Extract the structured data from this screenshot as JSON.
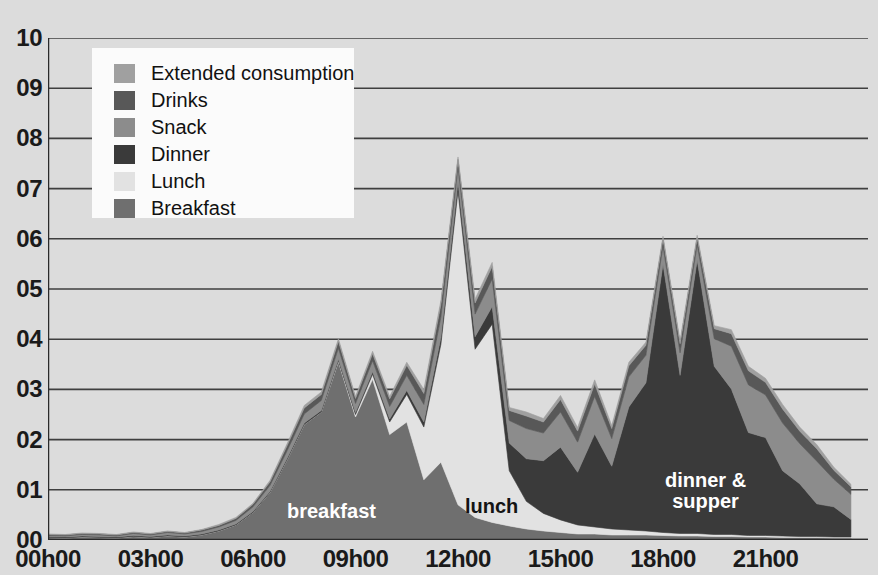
{
  "chart_data": {
    "type": "area",
    "stacked": true,
    "title": "",
    "xlabel": "",
    "ylabel": "",
    "ylim": [
      0,
      10
    ],
    "xlim": [
      0,
      24
    ],
    "grid": true,
    "legend_position": "top-left",
    "y_ticks": [
      "00",
      "01",
      "02",
      "03",
      "04",
      "05",
      "06",
      "07",
      "08",
      "09",
      "10"
    ],
    "x_ticks": [
      "00h00",
      "03h00",
      "06h00",
      "09h00",
      "12h00",
      "15h00",
      "18h00",
      "21h00"
    ],
    "x_tick_hours": [
      0,
      3,
      6,
      9,
      12,
      15,
      18,
      21
    ],
    "x": [
      0,
      0.5,
      1,
      1.5,
      2,
      2.5,
      3,
      3.5,
      4,
      4.5,
      5,
      5.5,
      6,
      6.5,
      7,
      7.5,
      8,
      8.5,
      9,
      9.5,
      10,
      10.5,
      11,
      11.5,
      12,
      12.5,
      13,
      13.5,
      14,
      14.5,
      15,
      15.5,
      16,
      16.5,
      17,
      17.5,
      18,
      18.5,
      19,
      19.5,
      20,
      20.5,
      21,
      21.5,
      22,
      22.5,
      23,
      23.5
    ],
    "series": [
      {
        "name": "Breakfast",
        "color": "#6f6f6f",
        "values": [
          0.05,
          0.04,
          0.06,
          0.05,
          0.04,
          0.07,
          0.05,
          0.08,
          0.06,
          0.1,
          0.18,
          0.3,
          0.55,
          0.95,
          1.6,
          2.3,
          2.55,
          3.55,
          2.45,
          3.2,
          2.1,
          2.35,
          1.2,
          1.55,
          0.7,
          0.45,
          0.35,
          0.28,
          0.22,
          0.18,
          0.15,
          0.12,
          0.12,
          0.1,
          0.1,
          0.1,
          0.09,
          0.08,
          0.08,
          0.07,
          0.07,
          0.06,
          0.06,
          0.05,
          0.05,
          0.05,
          0.04,
          0.04
        ]
      },
      {
        "name": "Lunch",
        "color": "#e2e2e2",
        "values": [
          0,
          0,
          0,
          0,
          0,
          0,
          0,
          0,
          0,
          0,
          0,
          0,
          0,
          0,
          0,
          0,
          0,
          0.02,
          0.05,
          0.1,
          0.25,
          0.55,
          1.05,
          2.35,
          6.25,
          3.35,
          3.95,
          1.1,
          0.55,
          0.35,
          0.25,
          0.18,
          0.14,
          0.12,
          0.1,
          0.08,
          0.06,
          0.05,
          0.05,
          0.04,
          0.04,
          0.03,
          0.03,
          0.03,
          0.02,
          0.02,
          0.02,
          0.02
        ]
      },
      {
        "name": "Dinner",
        "color": "#3a3a3a",
        "values": [
          0.02,
          0.02,
          0.02,
          0.02,
          0.02,
          0.02,
          0.02,
          0.02,
          0.02,
          0.02,
          0.02,
          0.02,
          0.02,
          0.02,
          0.03,
          0.03,
          0.03,
          0.03,
          0.04,
          0.05,
          0.06,
          0.08,
          0.1,
          0.14,
          0.18,
          0.25,
          0.35,
          0.55,
          0.85,
          1.05,
          1.45,
          1.05,
          1.85,
          1.25,
          2.45,
          2.95,
          5.35,
          3.15,
          5.45,
          3.35,
          2.9,
          2.05,
          1.95,
          1.3,
          1.05,
          0.65,
          0.6,
          0.35
        ]
      },
      {
        "name": "Snack",
        "color": "#8c8c8c",
        "values": [
          0.02,
          0.02,
          0.03,
          0.03,
          0.02,
          0.04,
          0.03,
          0.05,
          0.04,
          0.05,
          0.06,
          0.07,
          0.09,
          0.12,
          0.15,
          0.18,
          0.2,
          0.22,
          0.18,
          0.22,
          0.25,
          0.3,
          0.35,
          0.4,
          0.3,
          0.45,
          0.55,
          0.45,
          0.6,
          0.55,
          0.7,
          0.6,
          0.75,
          0.55,
          0.6,
          0.55,
          0.35,
          0.45,
          0.3,
          0.55,
          0.85,
          0.95,
          0.85,
          0.95,
          0.8,
          0.85,
          0.55,
          0.5
        ]
      },
      {
        "name": "Drinks",
        "color": "#585858",
        "values": [
          0.02,
          0.02,
          0.02,
          0.02,
          0.02,
          0.02,
          0.02,
          0.02,
          0.02,
          0.03,
          0.03,
          0.04,
          0.05,
          0.07,
          0.1,
          0.12,
          0.12,
          0.14,
          0.1,
          0.14,
          0.15,
          0.2,
          0.22,
          0.25,
          0.15,
          0.22,
          0.25,
          0.2,
          0.25,
          0.22,
          0.25,
          0.22,
          0.25,
          0.2,
          0.22,
          0.2,
          0.15,
          0.18,
          0.14,
          0.2,
          0.25,
          0.28,
          0.25,
          0.28,
          0.25,
          0.25,
          0.18,
          0.15
        ]
      },
      {
        "name": "Extended consumption",
        "color": "#a0a0a0",
        "values": [
          0.01,
          0.01,
          0.01,
          0.01,
          0.01,
          0.01,
          0.01,
          0.01,
          0.01,
          0.01,
          0.02,
          0.02,
          0.02,
          0.03,
          0.04,
          0.05,
          0.05,
          0.05,
          0.04,
          0.05,
          0.05,
          0.06,
          0.08,
          0.08,
          0.05,
          0.08,
          0.08,
          0.06,
          0.08,
          0.07,
          0.08,
          0.07,
          0.08,
          0.06,
          0.07,
          0.06,
          0.05,
          0.06,
          0.05,
          0.06,
          0.08,
          0.09,
          0.08,
          0.09,
          0.08,
          0.08,
          0.06,
          0.05
        ]
      }
    ]
  },
  "legend": {
    "items": [
      {
        "label": "Extended consumption",
        "color": "#a0a0a0"
      },
      {
        "label": "Drinks",
        "color": "#585858"
      },
      {
        "label": "Snack",
        "color": "#8c8c8c"
      },
      {
        "label": "Dinner",
        "color": "#3a3a3a"
      },
      {
        "label": "Lunch",
        "color": "#e2e2e2"
      },
      {
        "label": "Breakfast",
        "color": "#6f6f6f"
      }
    ]
  },
  "annotations": {
    "breakfast": "breakfast",
    "lunch": "lunch",
    "dinner": "dinner &\nsupper"
  },
  "colors": {
    "background": "#dcdcdc",
    "gridline": "#3f3f3f",
    "axis": "#2a2a2a",
    "text": "#1a1a1a",
    "legend_background": "#fbfbfb"
  }
}
